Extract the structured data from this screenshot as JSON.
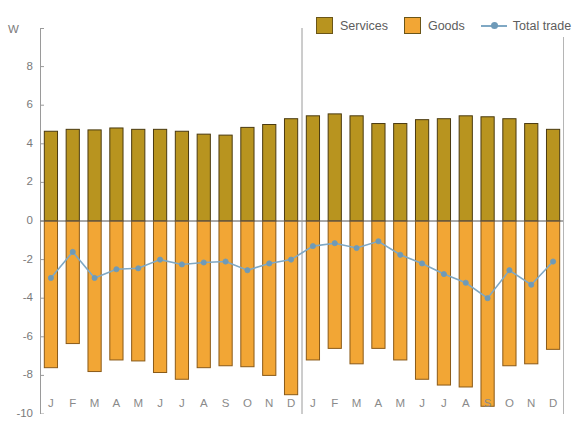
{
  "unit_label": "W",
  "legend": {
    "position": "top-right",
    "items": [
      {
        "name": "services",
        "label": "Services",
        "type": "bar",
        "color": "#b8941f"
      },
      {
        "name": "goods",
        "label": "Goods",
        "type": "bar",
        "color": "#f2a635"
      },
      {
        "name": "total_trade",
        "label": "Total trade",
        "type": "line",
        "color": "#7fa8c4"
      }
    ]
  },
  "axes": {
    "y_ticks": [
      "8",
      "6",
      "4",
      "2",
      "0",
      "-2",
      "-4",
      "-6",
      "-8",
      "-10"
    ],
    "y_min": -10,
    "y_max": 10,
    "x_labels": [
      "J",
      "F",
      "M",
      "A",
      "M",
      "J",
      "J",
      "A",
      "S",
      "O",
      "N",
      "D",
      "J",
      "F",
      "M",
      "A",
      "M",
      "J",
      "J",
      "A",
      "S",
      "O",
      "N",
      "D"
    ]
  },
  "chart_data": {
    "type": "bar",
    "title": "",
    "subtitle": "",
    "xlabel": "",
    "ylabel": "W",
    "ylim": [
      -10,
      10
    ],
    "grid": false,
    "legend_position": "top-right",
    "categories": [
      "J",
      "F",
      "M",
      "A",
      "M",
      "J",
      "J",
      "A",
      "S",
      "O",
      "N",
      "D",
      "J",
      "F",
      "M",
      "A",
      "M",
      "J",
      "J",
      "A",
      "S",
      "O",
      "N",
      "D"
    ],
    "series": [
      {
        "name": "Services",
        "type": "bar",
        "color": "#b8941f",
        "values": [
          4.65,
          4.75,
          4.72,
          4.82,
          4.75,
          4.75,
          4.65,
          4.5,
          4.45,
          4.85,
          5.0,
          5.3,
          5.45,
          5.55,
          5.45,
          5.05,
          5.05,
          5.25,
          5.3,
          5.45,
          5.4,
          5.3,
          5.05,
          4.75
        ]
      },
      {
        "name": "Goods",
        "type": "bar",
        "color": "#f2a635",
        "values": [
          -7.6,
          -6.35,
          -7.8,
          -7.2,
          -7.25,
          -7.85,
          -8.2,
          -7.6,
          -7.5,
          -7.55,
          -8.0,
          -9.0,
          -7.2,
          -6.6,
          -7.4,
          -6.6,
          -7.2,
          -8.2,
          -8.5,
          -8.6,
          -9.6,
          -7.5,
          -7.4,
          -6.65
        ]
      },
      {
        "name": "Total trade",
        "type": "line",
        "color": "#7fa8c4",
        "values": [
          -2.95,
          -1.6,
          -2.95,
          -2.5,
          -2.45,
          -2.0,
          -2.25,
          -2.15,
          -2.1,
          -2.55,
          -2.2,
          -2.0,
          -1.3,
          -1.15,
          -1.4,
          -1.05,
          -1.75,
          -2.2,
          -2.75,
          -3.2,
          -4.0,
          -2.55,
          -3.3,
          -2.1
        ]
      }
    ]
  },
  "year_divider_after_index": 11
}
